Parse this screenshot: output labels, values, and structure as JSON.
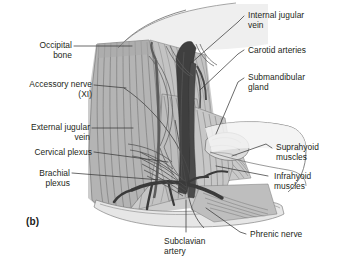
{
  "figure": {
    "designation": "(b)"
  },
  "labels": {
    "occipital_bone": "Occipital\nbone",
    "accessory_nerve": "Accessory nerve\n(XI)",
    "external_jugular_vein": "External jugular\nvein",
    "cervical_plexus": "Cervical plexus",
    "brachial_plexus": "Brachial\nplexus",
    "internal_jugular_vein": "Internal jugular\nvein",
    "carotid_arteries": "Carotid arteries",
    "submandibular_gland": "Submandibular\ngland",
    "suprahyoid_muscles": "Suprahyoid\nmuscles",
    "infrahyoid_muscles": "Infrahyoid\nmuscles",
    "subclavian_artery": "Subclavian\nartery",
    "phrenic_nerve": "Phrenic nerve"
  },
  "colors": {
    "background": "#ffffff",
    "text": "#231f20",
    "leader_line": "#3a3a3a",
    "muscle_mid": "#b9b9b9",
    "muscle_light": "#d6d6d6",
    "muscle_dark": "#9a9a9a",
    "striation": "#6e6e6e",
    "vessel_dark": "#3c3c3c",
    "vessel_mid": "#585858",
    "bone_light": "#e4e4e4",
    "skin_pale": "#ededed",
    "outline": "#4a4a4a"
  }
}
